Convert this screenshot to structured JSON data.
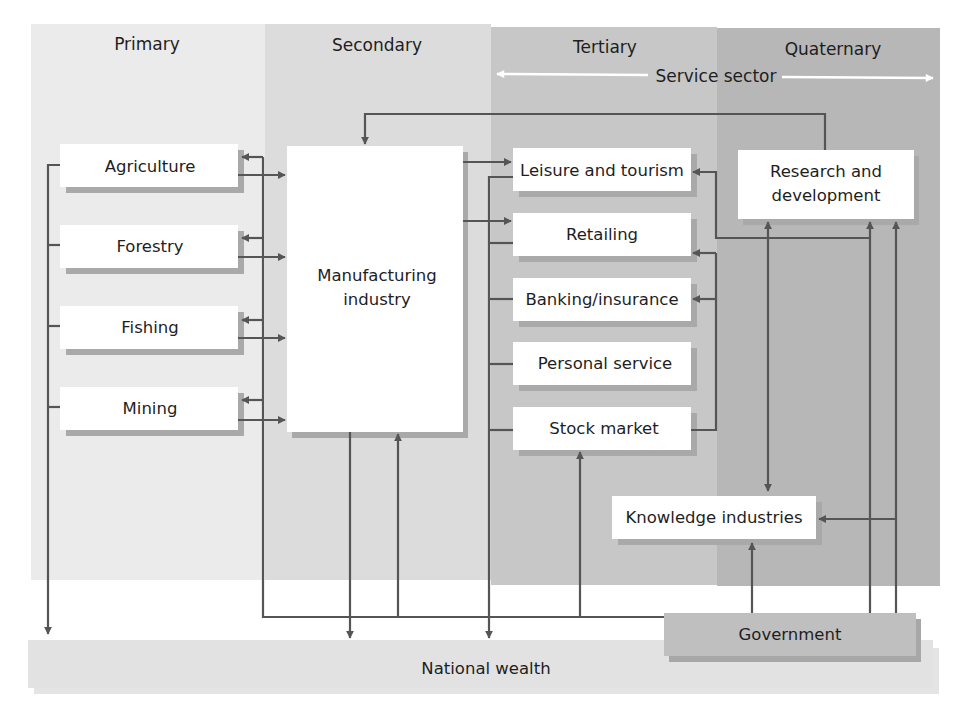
{
  "colors": {
    "primary_band": "#eaeaea",
    "secondary_band": "#dcdcdc",
    "tertiary_band": "#c6c6c6",
    "quaternary_band": "#b5b5b5",
    "box_fill": "#ffffff",
    "box_shadow": "#a8a8a8",
    "line": "#555555",
    "government_fill": "#bdbdbd",
    "national_wealth_fill": "#e2e2e2",
    "service_arrow": "#ffffff"
  },
  "columns": {
    "primary": "Primary",
    "secondary": "Secondary",
    "tertiary": "Tertiary",
    "quaternary": "Quaternary"
  },
  "service_sector": "Service sector",
  "primary_boxes": {
    "agriculture": "Agriculture",
    "forestry": "Forestry",
    "fishing": "Fishing",
    "mining": "Mining"
  },
  "secondary_boxes": {
    "manufacturing_line1": "Manufacturing",
    "manufacturing_line2": "industry"
  },
  "tertiary_boxes": {
    "leisure": "Leisure and tourism",
    "retailing": "Retailing",
    "banking": "Banking/insurance",
    "personal": "Personal service",
    "stock": "Stock market",
    "knowledge": "Knowledge industries"
  },
  "quaternary_boxes": {
    "rd_line1": "Research and",
    "rd_line2": "development"
  },
  "bottom": {
    "government": "Government",
    "national_wealth": "National wealth"
  }
}
